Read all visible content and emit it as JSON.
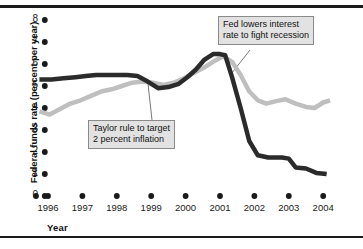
{
  "figure": {
    "axis_y_title": "Federal funds rate (percent per year)",
    "axis_x_title": "Year",
    "callout_fed_line1": "Fed lowers interest",
    "callout_fed_line2": "rate to fight recession",
    "callout_taylor_line1": "Taylor rule to target",
    "callout_taylor_line2": "2 percent inflation",
    "colors": {
      "federal_funds_line": "#2b2b2b",
      "taylor_rule_line": "#bfbfbf",
      "rule_bar": "#1a1a1a",
      "callout_fill": "#e2e2e2",
      "callout_border": "#8a8a8a",
      "background": "#ffffff"
    }
  },
  "chart_data": {
    "type": "line",
    "title": "",
    "xlabel": "Year",
    "ylabel": "Federal funds rate (percent per year)",
    "xlim": [
      1995.6,
      2004.3
    ],
    "ylim": [
      0,
      8
    ],
    "yticks": [
      0,
      1,
      2,
      3,
      4,
      5,
      6,
      7,
      8
    ],
    "ytick_labels": [
      "0",
      "1",
      "2",
      "3",
      "4",
      "5",
      "6",
      "7",
      "8"
    ],
    "xticks": [
      1996,
      1997,
      1998,
      1999,
      2000,
      2001,
      2002,
      2003,
      2004
    ],
    "xtick_labels": [
      "1996",
      "1997",
      "1998",
      "1999",
      "2000",
      "2001",
      "2002",
      "2003",
      "2004"
    ],
    "grid": false,
    "legend": "none",
    "marker_style": "filled-dot-ticks",
    "series": [
      {
        "name": "Federal funds rate",
        "color": "#2b2b2b",
        "linewidth": 4.5,
        "x": [
          1995.75,
          1996.1,
          1996.45,
          1996.8,
          1997.1,
          1997.4,
          1997.7,
          1998.0,
          1998.3,
          1998.6,
          1998.9,
          1999.2,
          1999.5,
          1999.8,
          2000.05,
          2000.3,
          2000.55,
          2000.8,
          2001.0,
          2001.15,
          2001.35,
          2001.6,
          2001.85,
          2002.1,
          2002.4,
          2002.8,
          2003.0,
          2003.2,
          2003.5,
          2003.8,
          2004.1
        ],
        "y": [
          5.3,
          5.3,
          5.35,
          5.4,
          5.45,
          5.5,
          5.5,
          5.5,
          5.5,
          5.45,
          5.2,
          4.9,
          4.95,
          5.1,
          5.4,
          5.75,
          6.2,
          6.45,
          6.45,
          6.4,
          5.4,
          4.0,
          2.5,
          1.85,
          1.75,
          1.75,
          1.7,
          1.3,
          1.25,
          1.05,
          1.0
        ]
      },
      {
        "name": "Taylor rule to target 2 percent inflation",
        "color": "#bfbfbf",
        "linewidth": 4.5,
        "x": [
          1995.75,
          1996.05,
          1996.35,
          1996.65,
          1996.95,
          1997.25,
          1997.55,
          1997.85,
          1998.15,
          1998.45,
          1998.75,
          1999.05,
          1999.35,
          1999.65,
          1999.95,
          2000.25,
          2000.55,
          2000.85,
          2001.1,
          2001.35,
          2001.6,
          2001.85,
          2002.1,
          2002.35,
          2002.6,
          2002.9,
          2003.2,
          2003.5,
          2003.75,
          2004.0,
          2004.2
        ],
        "y": [
          3.85,
          3.7,
          3.95,
          4.2,
          4.35,
          4.55,
          4.75,
          4.85,
          5.0,
          5.15,
          5.2,
          5.15,
          5.05,
          5.15,
          5.35,
          5.6,
          5.85,
          6.15,
          6.35,
          6.1,
          5.5,
          4.75,
          4.35,
          4.2,
          4.3,
          4.4,
          4.2,
          4.05,
          4.0,
          4.25,
          4.35
        ]
      }
    ],
    "annotations": [
      {
        "id": "fed-lowers",
        "text": "Fed lowers interest rate to fight recession",
        "box_x": 218,
        "box_y": 16,
        "target_x": 2001.35,
        "target_y": 5.4
      },
      {
        "id": "taylor-rule",
        "text": "Taylor rule to target 2 percent inflation",
        "box_x": 88,
        "box_y": 120,
        "target_x": 1998.85,
        "target_y": 5.15
      }
    ]
  }
}
